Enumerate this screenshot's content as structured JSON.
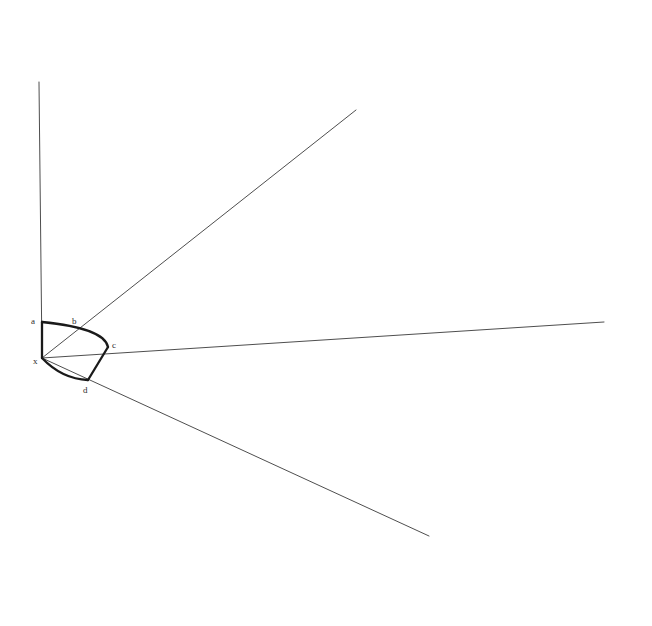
{
  "figure": {
    "background_color": "#ffffff",
    "ray_color": "#3a3a3a",
    "shape_color": "#1a1a1a",
    "label_color": "#2b2b2b",
    "width": 652,
    "height": 626
  },
  "points": {
    "x": {
      "label": "x",
      "cx": 42,
      "cy": 358,
      "label_x": 33,
      "label_y": 357
    },
    "a": {
      "label": "a",
      "cx": 42,
      "cy": 322,
      "label_x": 31,
      "label_y": 317
    },
    "b": {
      "label": "b",
      "cx": 76,
      "cy": 326,
      "label_x": 72,
      "label_y": 317
    },
    "c": {
      "label": "c",
      "cx": 108,
      "cy": 347,
      "label_x": 112,
      "label_y": 341
    },
    "d": {
      "label": "d",
      "cx": 88,
      "cy": 380,
      "label_x": 83,
      "label_y": 386
    }
  },
  "rays": [
    {
      "name": "ray-up-vertical",
      "x1": 42,
      "y1": 358,
      "x2": 39,
      "y2": 82
    },
    {
      "name": "ray-upper-right",
      "x1": 42,
      "y1": 358,
      "x2": 356,
      "y2": 110
    },
    {
      "name": "ray-horizontal-right",
      "x1": 42,
      "y1": 358,
      "x2": 604,
      "y2": 322
    },
    {
      "name": "ray-lower-right",
      "x1": 42,
      "y1": 358,
      "x2": 429,
      "y2": 536
    }
  ],
  "shape": {
    "segment_ax": {
      "name": "segment-a-to-x",
      "x1": 42,
      "y1": 322,
      "x2": 42,
      "y2": 358
    },
    "arc_abc": {
      "name": "arc-a-through-b-to-c",
      "path": "M 42 322 Q 104 328 108 347"
    },
    "segment_cd": {
      "name": "segment-c-to-d",
      "x1": 108,
      "y1": 347,
      "x2": 88,
      "y2": 380
    },
    "arc_dx": {
      "name": "arc-d-to-x",
      "path": "M 88 380 Q 62 379 42 358"
    }
  }
}
